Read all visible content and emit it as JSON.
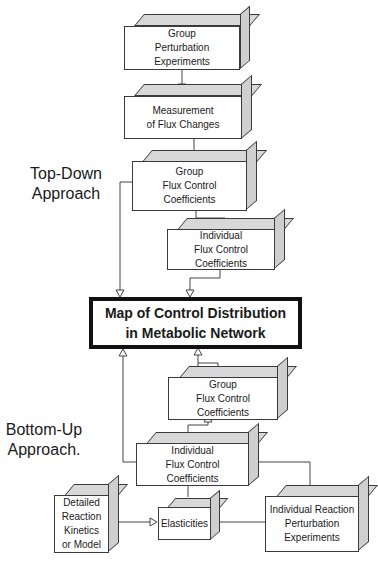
{
  "labels": {
    "top_down": [
      "Top-Down",
      "Approach"
    ],
    "bottom_up": [
      "Bottom-Up",
      "Approach."
    ]
  },
  "boxes": {
    "group_perturbation": [
      "Group",
      "Perturbation",
      "Experiments"
    ],
    "measurement_flux": [
      "Measurement",
      "of Flux Changes"
    ],
    "group_fcc_top": [
      "Group",
      "Flux Control",
      "Coefficients"
    ],
    "individual_fcc_top": [
      "Individual",
      "Flux Control",
      "Coefficients"
    ],
    "map": [
      "Map of Control Distribution",
      "in Metabolic Network"
    ],
    "group_fcc_bottom": [
      "Group",
      "Flux Control",
      "Coefficients"
    ],
    "individual_fcc_bottom": [
      "Individual",
      "Flux Control",
      "Coefficients"
    ],
    "detailed_kinetics": [
      "Detailed",
      "Reaction",
      "Kinetics",
      "or Model"
    ],
    "elasticities": [
      "Elasticities"
    ],
    "individual_reaction_perturbation": [
      "Individual Reaction",
      "Perturbation",
      "Experiments"
    ]
  },
  "colors": {
    "line": "#444444",
    "box_border": "#3a3a3a",
    "shade": "#d8d8d8",
    "map_border": "#111111"
  }
}
